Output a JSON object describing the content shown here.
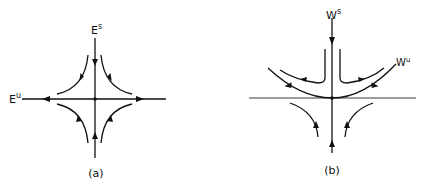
{
  "panels": [
    {
      "id": "a",
      "caption": "(a)",
      "labels": {
        "stable": {
          "base": "E",
          "sup": "s"
        },
        "unstable": {
          "base": "E",
          "sup": "u"
        }
      },
      "description": "Linear saddle: stable subspace E^s vertical (flow inward), unstable subspace E^u horizontal (flow outward), four hyperbolic trajectories in quadrants"
    },
    {
      "id": "b",
      "caption": "(b)",
      "labels": {
        "stable": {
          "base": "W",
          "sup": "s"
        },
        "unstable": {
          "base": "W",
          "sup": "u"
        }
      },
      "description": "Nonlinear saddle: stable manifold W^s vertical, unstable manifold W^u curved upward and tangent to horizontal line at the fixed point"
    }
  ]
}
